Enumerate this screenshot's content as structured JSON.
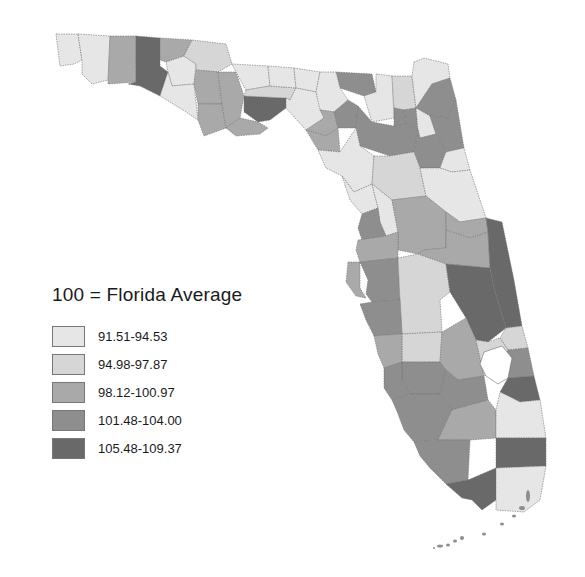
{
  "legend": {
    "title": "100 = Florida Average",
    "items": [
      {
        "label": "91.51-94.53",
        "color": "#e6e6e6"
      },
      {
        "label": "94.98-97.87",
        "color": "#d6d6d6"
      },
      {
        "label": "98.12-100.97",
        "color": "#a9a9a9"
      },
      {
        "label": "101.48-104.00",
        "color": "#8e8e8e"
      },
      {
        "label": "105.48-109.37",
        "color": "#696969"
      }
    ]
  },
  "map": {
    "region": "Florida",
    "unit": "county",
    "classes": 5
  }
}
